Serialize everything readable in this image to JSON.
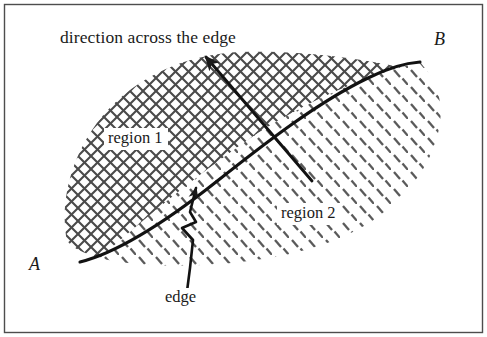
{
  "figure": {
    "type": "line-diagram",
    "caption_text": "Schematic of an edge separating two differently hatched regions between endpoints A and B.",
    "frame": {
      "border_color": "#4d4d4d",
      "border_width_px": 1,
      "inset_px": 4,
      "background": "#ffffff"
    },
    "ink_color": "#1a1a1a",
    "hatch_color": "#555555",
    "labels": {
      "title": "direction across the edge",
      "region1": "region 1",
      "region2": "region 2",
      "edge": "edge",
      "point_a": "A",
      "point_b": "B"
    },
    "annotations": [
      {
        "name": "direction-arrow",
        "label": "direction across the edge",
        "from": [
          312,
          181
        ],
        "to": [
          206,
          57
        ],
        "arrowhead_at": "to",
        "crosses": "edge"
      },
      {
        "name": "edge-leader",
        "label": "edge",
        "from": [
          186,
          288
        ],
        "to": [
          196,
          188
        ],
        "arrowhead_at": "to",
        "style": "kinked"
      }
    ],
    "regions": [
      {
        "name": "region 1",
        "hatch": "crosshatch",
        "position": "upper-left of edge"
      },
      {
        "name": "region 2",
        "hatch": "diagonal-dashes",
        "position": "lower-right of edge"
      }
    ],
    "edge": {
      "name": "edge",
      "from_label": "A",
      "to_label": "B",
      "from_point": [
        80,
        262
      ],
      "to_point": [
        420,
        62
      ]
    }
  }
}
